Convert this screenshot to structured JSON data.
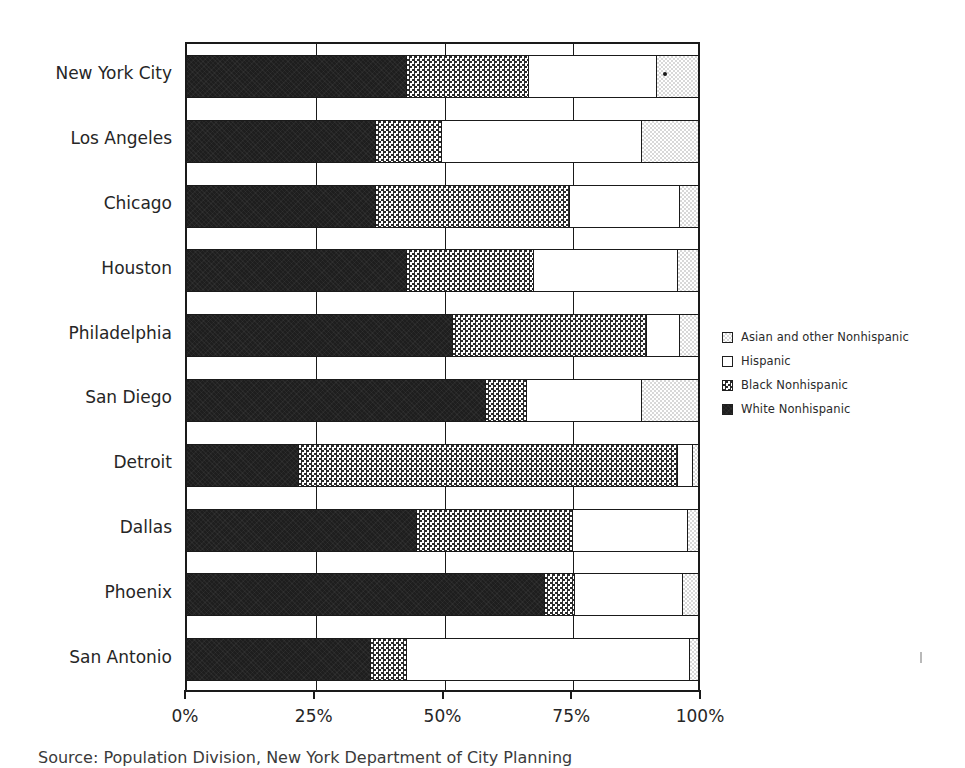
{
  "chart_data": {
    "type": "bar",
    "orientation": "horizontal",
    "stacked": true,
    "normalized_percent": true,
    "title": "",
    "subtitle": "",
    "xlabel": "",
    "ylabel": "",
    "xlim": [
      0,
      100
    ],
    "xticks": [
      0,
      25,
      50,
      75,
      100
    ],
    "xticklabels": [
      "0%",
      "25%",
      "50%",
      "75%",
      "100%"
    ],
    "grid": true,
    "legend_position": "right",
    "categories": [
      "New York City",
      "Los Angeles",
      "Chicago",
      "Houston",
      "Philadelphia",
      "San Diego",
      "Detroit",
      "Dallas",
      "Phoenix",
      "San Antonio"
    ],
    "series": [
      {
        "name": "White Nonhispanic",
        "pattern": "solid-dark",
        "values": [
          43.0,
          37.0,
          37.0,
          43.0,
          52.0,
          58.5,
          22.0,
          45.0,
          70.0,
          36.0
        ]
      },
      {
        "name": "Black Nonhispanic",
        "pattern": "checkerboard",
        "values": [
          24.0,
          13.0,
          38.0,
          25.0,
          38.0,
          8.0,
          74.0,
          30.5,
          6.0,
          7.0
        ]
      },
      {
        "name": "Hispanic",
        "pattern": "white",
        "values": [
          25.0,
          39.0,
          21.5,
          28.0,
          6.5,
          22.5,
          3.0,
          22.5,
          21.0,
          55.5
        ]
      },
      {
        "name": "Asian and other Nonhispanic",
        "pattern": "light-stipple",
        "values": [
          8.0,
          11.0,
          3.5,
          4.0,
          3.5,
          11.0,
          1.0,
          2.0,
          3.0,
          1.5
        ]
      }
    ]
  },
  "legend": {
    "items": [
      {
        "label": "Asian and other Nonhispanic",
        "swatch": "light-stipple"
      },
      {
        "label": "Hispanic",
        "swatch": "white"
      },
      {
        "label": "Black Nonhispanic",
        "swatch": "checkerboard"
      },
      {
        "label": "White Nonhispanic",
        "swatch": "solid-dark"
      }
    ]
  },
  "caption": {
    "text": "Source: Population Division, New York Department of City Planning"
  },
  "colors": {
    "axis": "#1a1a1a",
    "text": "#262626",
    "white_nonhispanic": "#1e1e1e",
    "black_nonhispanic": "#2b2b2b",
    "hispanic": "#ffffff",
    "asian_other": "#d8d8d8"
  }
}
